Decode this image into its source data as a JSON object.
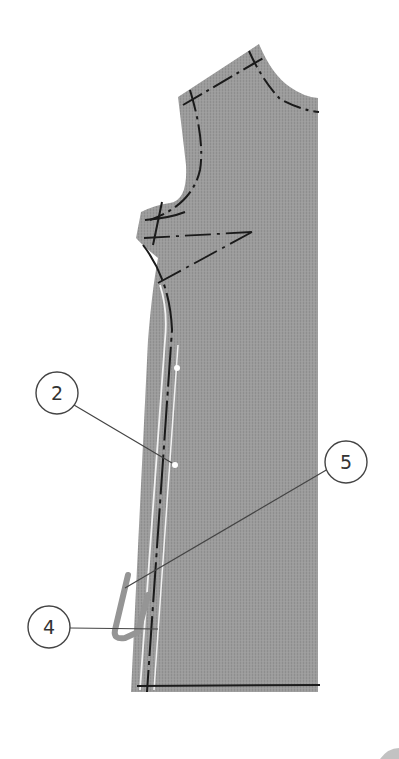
{
  "diagram": {
    "colors": {
      "fabric": "#9a9a9a",
      "fabric_stripe": "#8f8f8f",
      "stitch_line": "#1a1a1a",
      "fold_line": "#f2f2f2",
      "callout_stroke": "#444444",
      "callout_fill": "#ffffff",
      "background": "#ffffff"
    },
    "callouts": [
      {
        "id": "callout-2",
        "label": "2"
      },
      {
        "id": "callout-5",
        "label": "5"
      },
      {
        "id": "callout-4",
        "label": "4"
      }
    ]
  }
}
